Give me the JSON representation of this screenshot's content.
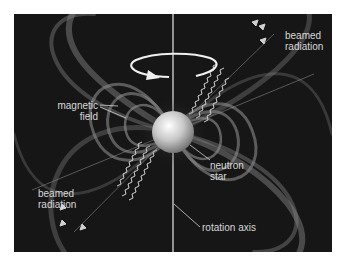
{
  "diagram": {
    "background_color": "#161616",
    "labels": {
      "beamed_radiation_top": "beamed\nradiation",
      "beamed_radiation_top_line1": "beamed",
      "beamed_radiation_top_line2": "radiation",
      "magnetic_field_line1": "magnetic",
      "magnetic_field_line2": "field",
      "neutron_star_line1": "neutron",
      "neutron_star_line2": "star",
      "beamed_radiation_bottom_line1": "beamed",
      "beamed_radiation_bottom_line2": "radiation",
      "rotation_axis": "rotation axis"
    },
    "elements": [
      "neutron-star-sphere",
      "rotation-axis-line",
      "rotation-arrow",
      "magnetic-field-loops",
      "radiation-beams"
    ]
  }
}
